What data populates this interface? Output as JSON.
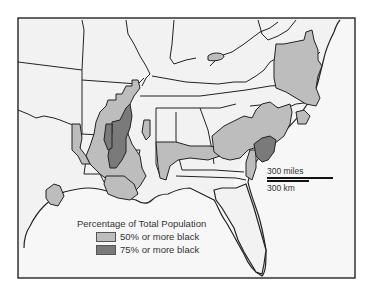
{
  "map": {
    "region": "Southeastern United States",
    "colors": {
      "background": "#f2f2f2",
      "land": "#f2f2f2",
      "border": "#222222",
      "fill_50": "#bdbdbd",
      "fill_75": "#7a7a7a"
    }
  },
  "legend": {
    "title": "Percentage of Total Population",
    "items": [
      {
        "label": "50% or more black",
        "color": "#bdbdbd"
      },
      {
        "label": "75% or more black",
        "color": "#7a7a7a"
      }
    ]
  },
  "scale": {
    "miles_label": "300 miles",
    "km_label": "300 km"
  }
}
